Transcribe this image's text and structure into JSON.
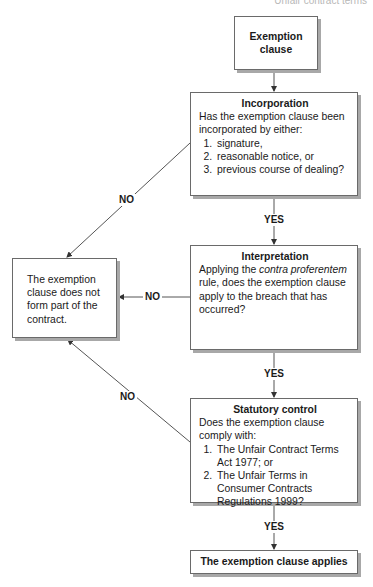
{
  "header": {
    "running_title": "Unfair contract terms"
  },
  "nodes": {
    "start": {
      "label": "Exemption clause"
    },
    "incorporation": {
      "title": "Incorporation",
      "question": "Has the exemption clause been incorporated by either:",
      "options": [
        "signature,",
        "reasonable notice, or",
        "previous course of dealing?"
      ]
    },
    "interpretation": {
      "title": "Interpretation",
      "question_prefix": "Applying the ",
      "question_italic": "contra proferentem",
      "question_suffix": " rule, does the exemption clause apply to the breach that has occurred?"
    },
    "statutory_control": {
      "title": "Statutory control",
      "question": "Does the exemption clause comply with:",
      "options": [
        "The Unfair Contract Terms Act 1977; or",
        "The Unfair Terms in Consumer Contracts Regulations 1999?"
      ]
    },
    "not_part": {
      "label": "The exemption clause does not form part of the contract."
    },
    "applies": {
      "label": "The exemption clause applies"
    }
  },
  "edges": {
    "incorporation_no": "NO",
    "incorporation_yes": "YES",
    "interpretation_no": "NO",
    "interpretation_yes": "YES",
    "statutory_no": "NO",
    "statutory_yes": "YES"
  },
  "colors": {
    "border": "#6a6a6a",
    "shadow": "#a8a8a8",
    "line": "#555555",
    "text": "#1a1a1a"
  }
}
